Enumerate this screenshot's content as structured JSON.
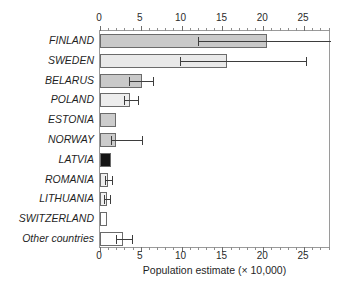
{
  "chart_data": {
    "type": "bar",
    "orientation": "horizontal",
    "title": "",
    "xlabel": "Population estimate (× 10,000)",
    "ylabel": "",
    "xlim": [
      0,
      28.3
    ],
    "xticks": [
      0,
      5,
      10,
      15,
      20,
      25
    ],
    "xtick_labels": [
      "0",
      "5",
      "10",
      "15",
      "20",
      "25"
    ],
    "minor_tick_step": 1,
    "grid": false,
    "legend": "none",
    "axis_positions": [
      "top",
      "bottom"
    ],
    "categories": [
      "FINLAND",
      "SWEDEN",
      "BELARUS",
      "POLAND",
      "ESTONIA",
      "NORWAY",
      "LATVIA",
      "ROMANIA",
      "LITHUANIA",
      "SWITZERLAND",
      "Other countries"
    ],
    "values": [
      20.5,
      15.6,
      5.2,
      3.7,
      2.0,
      2.0,
      1.3,
      1.0,
      0.9,
      0.9,
      2.8
    ],
    "error_low": [
      12.0,
      9.8,
      3.6,
      3.0,
      2.0,
      1.4,
      1.3,
      0.6,
      0.5,
      0.9,
      1.9
    ],
    "error_high": [
      28.3,
      25.2,
      6.5,
      4.6,
      2.0,
      5.2,
      1.3,
      1.5,
      1.2,
      0.9,
      3.9
    ],
    "bar_colors": [
      "#c9c9c9",
      "#e9e9e9",
      "#c9c9c9",
      "#ededed",
      "#cccccc",
      "#cbcbcb",
      "#141414",
      "#efefef",
      "#f0f0f0",
      "#ffffff",
      "#ffffff"
    ],
    "bar_edge_color": "#6b6b6b",
    "error_bar_color": "#3d3d3d",
    "frame_color": "#9a9a9a",
    "text_color": "#1f1f1f",
    "background": "#ffffff"
  }
}
